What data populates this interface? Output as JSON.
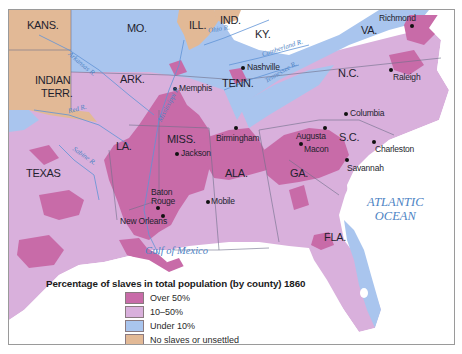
{
  "map": {
    "title": "Percentage of slaves in total population (by county) 1860",
    "colors": {
      "over_50": "#c86ba8",
      "between_10_50": "#d9b0dc",
      "under_10": "#a9c5ee",
      "no_slaves": "#e2b996",
      "water": "#ffffff",
      "river": "#5f93d6",
      "border": "#6f6f8a"
    },
    "states": [
      {
        "name": "KANS.",
        "category": "No slaves or unsettled"
      },
      {
        "name": "MO.",
        "category": "Under 10%"
      },
      {
        "name": "ILL.",
        "category": "No slaves or unsettled"
      },
      {
        "name": "IND.",
        "category": "No slaves or unsettled"
      },
      {
        "name": "KY.",
        "category": "10–50%"
      },
      {
        "name": "VA.",
        "category": "10–50%"
      },
      {
        "name": "INDIAN TERR.",
        "category": "No slaves or unsettled"
      },
      {
        "name": "ARK.",
        "category": "10–50%"
      },
      {
        "name": "TENN.",
        "category": "10–50%"
      },
      {
        "name": "N.C.",
        "category": "10–50%"
      },
      {
        "name": "MISS.",
        "category": "Over 50%"
      },
      {
        "name": "LA.",
        "category": "10–50%"
      },
      {
        "name": "ALA.",
        "category": "Over 50%"
      },
      {
        "name": "GA.",
        "category": "10–50%"
      },
      {
        "name": "S.C.",
        "category": "Over 50%"
      },
      {
        "name": "TEXAS",
        "category": "10–50%"
      },
      {
        "name": "FLA.",
        "category": "10–50%"
      }
    ],
    "cities": [
      "Richmond",
      "Memphis",
      "Nashville",
      "Raleigh",
      "Columbia",
      "Birmingham",
      "Augusta",
      "Charleston",
      "Jackson",
      "Macon",
      "Savannah",
      "Baton Rouge",
      "Mobile",
      "New Orleans"
    ],
    "rivers": [
      "Ohio R.",
      "Cumberland R.",
      "Tennessee R.",
      "Arkansas R.",
      "Mississippi R.",
      "Red R.",
      "Sabine R."
    ],
    "water_bodies": [
      "ATLANTIC OCEAN",
      "Gulf of Mexico"
    ]
  },
  "labels": {
    "kans": "KANS.",
    "mo": "MO.",
    "ill": "ILL.",
    "ind": "IND.",
    "ky": "KY.",
    "va": "VA.",
    "indian_terr_1": "INDIAN",
    "indian_terr_2": "TERR.",
    "ark": "ARK.",
    "tenn": "TENN.",
    "nc": "N.C.",
    "miss": "MISS.",
    "la": "LA.",
    "ala": "ALA.",
    "ga": "GA.",
    "sc": "S.C.",
    "texas": "TEXAS",
    "fla": "FLA.",
    "richmond": "Richmond",
    "memphis": "Memphis",
    "nashville": "Nashville",
    "raleigh": "Raleigh",
    "columbia": "Columbia",
    "birmingham": "Birmingham",
    "augusta": "Augusta",
    "charleston": "Charleston",
    "jackson": "Jackson",
    "macon": "Macon",
    "savannah": "Savannah",
    "baton_rouge_1": "Baton",
    "baton_rouge_2": "Rouge",
    "mobile": "Mobile",
    "new_orleans": "New Orleans",
    "ohio_r": "Ohio R.",
    "cumberland_r": "Cumberland R.",
    "tennessee_r": "Tennessee R.",
    "arkansas_r": "Arkansas R.",
    "mississippi_r": "Mississippi R.",
    "red_r": "Red R.",
    "sabine_r": "Sabine R.",
    "atlantic_1": "ATLANTIC",
    "atlantic_2": "OCEAN",
    "gulf": "Gulf of Mexico"
  },
  "legend": {
    "title": "Percentage of slaves in total population (by county) 1860",
    "items": [
      {
        "label": "Over 50%",
        "color": "#c86ba8"
      },
      {
        "label": "10–50%",
        "color": "#d9b0dc"
      },
      {
        "label": "Under 10%",
        "color": "#a9c5ee"
      },
      {
        "label": "No slaves or unsettled",
        "color": "#e2b996"
      }
    ]
  }
}
